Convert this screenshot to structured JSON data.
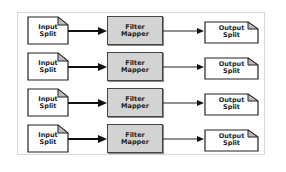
{
  "diagram": {
    "rows": [
      {
        "input": {
          "line1": "Input",
          "line2": "Split"
        },
        "mapper": {
          "line1": "Filter",
          "line2": "Mapper"
        },
        "output": {
          "line1": "Output",
          "line2": "Split"
        }
      },
      {
        "input": {
          "line1": "Input",
          "line2": "Split"
        },
        "mapper": {
          "line1": "Filter",
          "line2": "Mapper"
        },
        "output": {
          "line1": "Output",
          "line2": "Split"
        }
      },
      {
        "input": {
          "line1": "Input",
          "line2": "Split"
        },
        "mapper": {
          "line1": "Filter",
          "line2": "Mapper"
        },
        "output": {
          "line1": "Output",
          "line2": "Split"
        }
      },
      {
        "input": {
          "line1": "Input",
          "line2": "Split"
        },
        "mapper": {
          "line1": "Filter",
          "line2": "Mapper"
        },
        "output": {
          "line1": "Output",
          "line2": "Split"
        }
      }
    ],
    "colors": {
      "mapper_fill": "#d3d3d3",
      "stroke": "#222222",
      "frame_border": "#d8d8d8",
      "fold_fill": "#bbbbbb"
    }
  }
}
